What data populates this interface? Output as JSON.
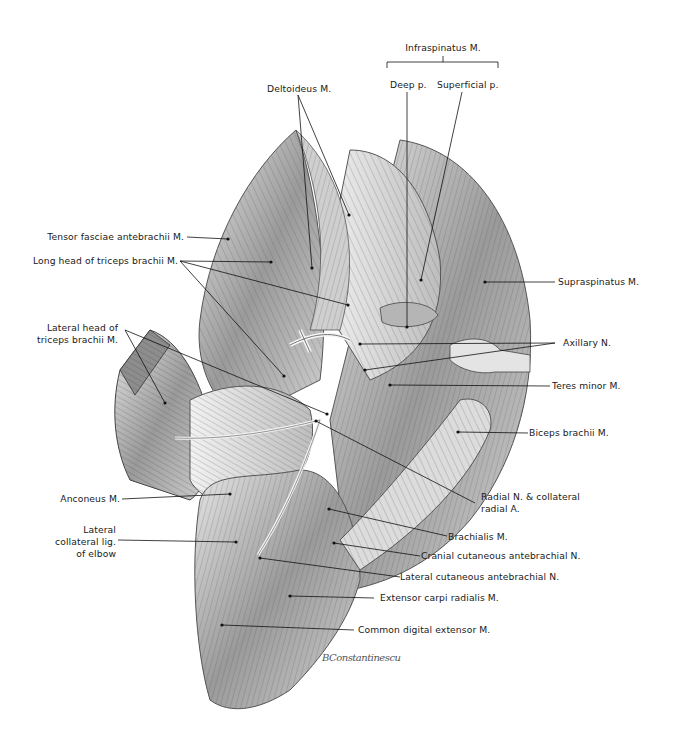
{
  "figure": {
    "type": "anatomical-illustration",
    "signature": "BConstantinescu"
  },
  "labels": {
    "infraspinatus": "Infraspinatus M.",
    "infraspinatus_deep": "Deep p.",
    "infraspinatus_superficial": "Superficial p.",
    "deltoideus": "Deltoideus M.",
    "tensor_fasciae": "Tensor fasciae antebrachii M.",
    "long_head_triceps": "Long head of triceps brachii M.",
    "lateral_head_triceps_1": "Lateral head of",
    "lateral_head_triceps_2": "triceps brachii M.",
    "supraspinatus": "Supraspinatus M.",
    "axillary_n": "Axillary N.",
    "teres_minor": "Teres minor M.",
    "biceps_brachii": "Biceps brachii M.",
    "anconeus": "Anconeus M.",
    "lateral_collateral_1": "Lateral",
    "lateral_collateral_2": "collateral lig.",
    "lateral_collateral_3": "of elbow",
    "radial_n_1": "Radial N. & collateral",
    "radial_n_2": "radial A.",
    "brachialis": "Brachialis M.",
    "cranial_cutaneous": "Cranial cutaneous antebrachial N.",
    "lateral_cutaneous": "Lateral cutaneous antebrachial N.",
    "extensor_carpi": "Extensor carpi radialis M.",
    "common_digital": "Common digital extensor M."
  },
  "colors": {
    "background": "#ffffff",
    "ink": "#1a1a1a",
    "shade_dark": "#6f6f6f",
    "shade_mid": "#a8a8a8",
    "shade_light": "#d9d9d9"
  }
}
